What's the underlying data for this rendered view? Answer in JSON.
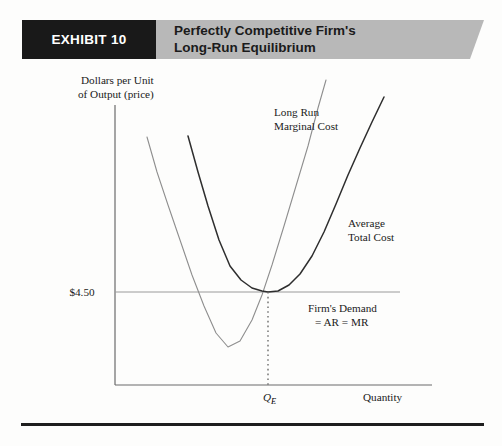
{
  "exhibit": {
    "label": "EXHIBIT 10",
    "title_line1": "Perfectly Competitive Firm's",
    "title_line2": "Long-Run Equilibrium",
    "banner_color": "#b8b8b8",
    "label_bg_color": "#191919",
    "label_text_color": "#ffffff",
    "rule_color": "#1e1e1e"
  },
  "chart_data": {
    "type": "line",
    "title": "Perfectly Competitive Firm's Long-Run Equilibrium",
    "ylabel_line1": "Dollars per Unit",
    "ylabel_line2": "of Output (price)",
    "xlabel": "Quantity",
    "grid": false,
    "legend": "inline-annotations",
    "y_ticks": [
      {
        "value": 4.5,
        "label": "$4.50"
      }
    ],
    "x_ticks": [
      {
        "label": "Q",
        "sub": "E"
      }
    ],
    "series": [
      {
        "name": "Long Run Marginal Cost",
        "label_line1": "Long Run",
        "label_line2": "Marginal Cost",
        "color": "#8e8e8e",
        "width": 1.1,
        "minimum": {
          "x": 228,
          "y": 347
        },
        "points": "147,137 157,172 168,205 180,240 192,275 204,306 216,333 228,347 240,341 252,320 262,295 272,265 284,226 296,186 308,146 318,108 326,80"
      },
      {
        "name": "Average Total Cost",
        "label_line1": "Average",
        "label_line2": "Total Cost",
        "color": "#2e2e2e",
        "width": 1.5,
        "minimum": {
          "x": 268,
          "y": 292
        },
        "points": "188,136 198,172 208,206 219,240 230,266 241,280 252,288 262,291 268,292 278,291 289,285 300,274 312,256 324,232 336,204 348,175 360,148 372,122 384,97"
      },
      {
        "name": "Firm's Demand = AR = MR",
        "label_line1": "Firm's Demand",
        "label_line2": "= AR = MR",
        "color": "#9a9a9a",
        "width": 1.0,
        "horizontal_at_y": 292,
        "x_from": 115,
        "x_to": 400
      }
    ],
    "equilibrium": {
      "price": "$4.50",
      "quantity_label": "Q",
      "quantity_sub": "E",
      "point_x": 268,
      "point_y": 292,
      "dropline_to_y": 385
    },
    "axes": {
      "origin_x": 115,
      "origin_y": 385,
      "y_top": 105,
      "x_right": 432,
      "color": "#6b6b6b"
    }
  }
}
